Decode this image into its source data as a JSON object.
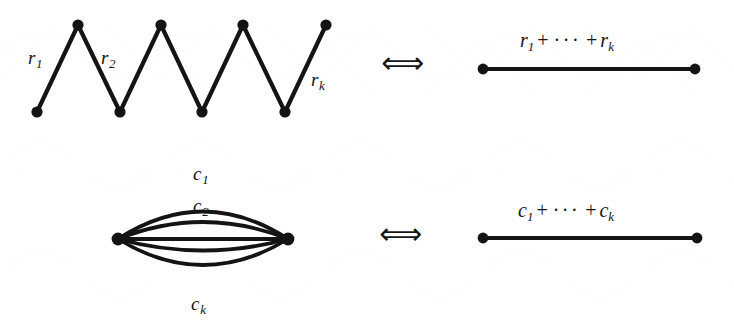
{
  "figure": {
    "type": "graph-equivalence-diagram",
    "background_color": "#ffffff",
    "ink_color": "#141414",
    "rows": [
      {
        "id": "row-resistors-series",
        "left_graph": {
          "kind": "zigzag-path",
          "description": "series chain of k edges drawn as a zigzag",
          "vertex_count": 8,
          "vertices": [
            {
              "x": 37,
              "y": 112
            },
            {
              "x": 78,
              "y": 25
            },
            {
              "x": 120,
              "y": 112
            },
            {
              "x": 161,
              "y": 25
            },
            {
              "x": 202,
              "y": 112
            },
            {
              "x": 243,
              "y": 25
            },
            {
              "x": 285,
              "y": 112
            },
            {
              "x": 326,
              "y": 25
            }
          ],
          "edge_labels": [
            {
              "name": "r-1-label",
              "base": "r",
              "sub": "1",
              "x": 28,
              "y": 48
            },
            {
              "name": "r-2-label",
              "base": "r",
              "sub": "2",
              "x": 101,
              "y": 48
            },
            {
              "name": "r-k-label",
              "base": "r",
              "sub": "k",
              "x": 311,
              "y": 70
            }
          ]
        },
        "arrow": {
          "glyph": "⟺",
          "name": "equivalence-arrow",
          "x": 381,
          "y": 48
        },
        "right_graph": {
          "kind": "single-edge",
          "endpoints": [
            {
              "x": 483,
              "y": 69
            },
            {
              "x": 695,
              "y": 69
            }
          ],
          "label": {
            "name": "r-sum-label",
            "terms": [
              "r",
              "r"
            ],
            "first_sub": "1",
            "last_sub": "k",
            "plus": "+",
            "dots": "···",
            "x": 520,
            "y": 30
          }
        }
      },
      {
        "id": "row-capacitors-parallel",
        "left_graph": {
          "kind": "multi-edge-bundle",
          "description": "k parallel edges between two vertices",
          "vertices": [
            {
              "x": 118,
              "y": 239
            },
            {
              "x": 288,
              "y": 239
            }
          ],
          "edge_count": 5,
          "arc_offsets": [
            -55,
            -34,
            0,
            23,
            51
          ],
          "edge_labels": [
            {
              "name": "c-1-label",
              "base": "c",
              "sub": "1",
              "x": 193,
              "y": 164
            },
            {
              "name": "c-2-label",
              "base": "c",
              "sub": "2",
              "x": 193,
              "y": 196
            },
            {
              "name": "c-k-label",
              "base": "c",
              "sub": "k",
              "x": 191,
              "y": 294
            }
          ]
        },
        "arrow": {
          "glyph": "⟺",
          "name": "equivalence-arrow",
          "x": 379,
          "y": 219
        },
        "right_graph": {
          "kind": "single-edge",
          "endpoints": [
            {
              "x": 483,
              "y": 238
            },
            {
              "x": 697,
              "y": 238
            }
          ],
          "label": {
            "name": "c-sum-label",
            "terms": [
              "c",
              "c"
            ],
            "first_sub": "1",
            "last_sub": "k",
            "plus": "+",
            "dots": "···",
            "x": 518,
            "y": 200
          }
        }
      }
    ]
  },
  "text": {
    "r1_base": "r",
    "r1_sub": "1",
    "r2_base": "r",
    "r2_sub": "2",
    "rk_base": "r",
    "rk_sub": "k",
    "c1_base": "c",
    "c1_sub": "1",
    "c2_base": "c",
    "c2_sub": "2",
    "ck_base": "c",
    "ck_sub": "k",
    "plus": "+",
    "dots": "···",
    "arrow_top": "⟺",
    "arrow_bottom": "⟺"
  }
}
